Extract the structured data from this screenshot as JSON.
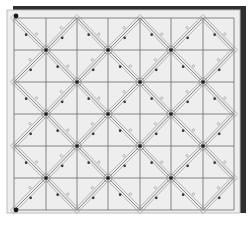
{
  "diagram": {
    "type": "diamond-lattice-grid",
    "grid": {
      "columns": 7,
      "rows": 6,
      "x_lines": [
        14,
        46,
        77,
        108,
        140,
        171,
        203,
        234
      ],
      "y_lines": [
        18,
        50,
        82,
        114,
        146,
        178,
        210
      ]
    },
    "colors": {
      "background": "#ffffff",
      "panel": "#eeeeee",
      "panel_border": "#bdbdbd",
      "shadow": "#2f2f2f",
      "grid_line": "#6a6a6a",
      "diagonal_line": "#7a7a7a",
      "node": "#1a1a1a",
      "marker_dark": "#333333",
      "marker_light": "#9a9a9a"
    },
    "corner_markers": [
      {
        "name": "top-left-anchor",
        "x": 16,
        "y": 16
      },
      {
        "name": "bottom-left-anchor",
        "x": 16,
        "y": 210
      }
    ]
  }
}
